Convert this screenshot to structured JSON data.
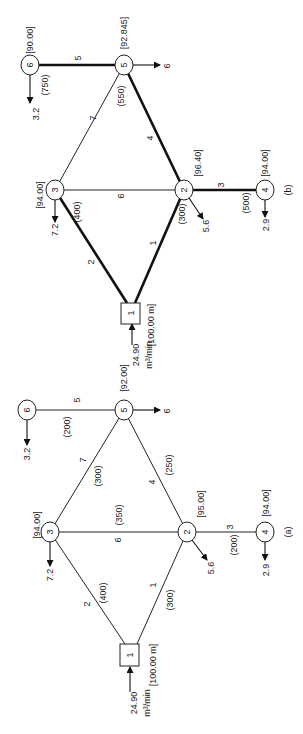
{
  "figure": {
    "panels": [
      {
        "id": "b",
        "label": "(b)",
        "nodes": [
          {
            "id": "1",
            "shape": "box",
            "head": "[100.00 m]",
            "inflow": "24.90",
            "inflow_unit": "m³/min"
          },
          {
            "id": "2",
            "shape": "circle",
            "head": "[96.40]",
            "demand": "5.6"
          },
          {
            "id": "3",
            "shape": "circle",
            "head": "[94.00]",
            "demand": "7.2"
          },
          {
            "id": "4",
            "shape": "circle",
            "head": "[94.00]",
            "demand": "2.9"
          },
          {
            "id": "5",
            "shape": "circle",
            "head": "[92.845]",
            "demand": "6"
          },
          {
            "id": "6",
            "shape": "circle",
            "head": "[90.00]",
            "demand": "3.2"
          }
        ],
        "pipes": [
          {
            "id": "1",
            "from": "1",
            "to": "2",
            "diameter": "(300)",
            "bold": true
          },
          {
            "id": "2",
            "from": "1",
            "to": "3",
            "diameter": "(400)",
            "bold": true
          },
          {
            "id": "3",
            "from": "2",
            "to": "4",
            "diameter": "(500)",
            "bold": true
          },
          {
            "id": "4",
            "from": "2",
            "to": "5",
            "diameter": "(550)",
            "bold": true
          },
          {
            "id": "5",
            "from": "5",
            "to": "6",
            "diameter": "(750)",
            "bold": true
          },
          {
            "id": "6",
            "from": "3",
            "to": "2",
            "diameter": "",
            "bold": false
          },
          {
            "id": "7",
            "from": "3",
            "to": "5",
            "diameter": "",
            "bold": false
          }
        ]
      },
      {
        "id": "a",
        "label": "(a)",
        "nodes": [
          {
            "id": "1",
            "shape": "box",
            "head": "[100.00 m]",
            "inflow": "24.90",
            "inflow_unit": "m³/min"
          },
          {
            "id": "2",
            "shape": "circle",
            "head": "[95.00]",
            "demand": "5.6"
          },
          {
            "id": "3",
            "shape": "circle",
            "head": "[94.00]",
            "demand": "7.2"
          },
          {
            "id": "4",
            "shape": "circle",
            "head": "[94.00]",
            "demand": "2.9"
          },
          {
            "id": "5",
            "shape": "circle",
            "head": "[92.00]",
            "demand": "6"
          },
          {
            "id": "6",
            "shape": "circle",
            "head": "",
            "demand": "3.2"
          }
        ],
        "pipes": [
          {
            "id": "1",
            "from": "1",
            "to": "2",
            "diameter": "(300)",
            "bold": false
          },
          {
            "id": "2",
            "from": "1",
            "to": "3",
            "diameter": "(400)",
            "bold": false
          },
          {
            "id": "3",
            "from": "2",
            "to": "4",
            "diameter": "(200)",
            "bold": false
          },
          {
            "id": "4",
            "from": "2",
            "to": "5",
            "diameter": "(250)",
            "bold": false
          },
          {
            "id": "5",
            "from": "5",
            "to": "6",
            "diameter": "(200)",
            "bold": false
          },
          {
            "id": "6",
            "from": "3",
            "to": "2",
            "diameter": "(350)",
            "bold": false
          },
          {
            "id": "7",
            "from": "3",
            "to": "5",
            "diameter": "(300)",
            "bold": false
          }
        ]
      }
    ]
  },
  "b": {
    "label": "(b)",
    "n1": "1",
    "n2": "2",
    "n3": "3",
    "n4": "4",
    "n5": "5",
    "n6": "6",
    "h1": "[100.00 m]",
    "h2": "[96.40]",
    "h3": "[94.00]",
    "h4": "[94.00]",
    "h5": "[92.845]",
    "h6": "[90.00]",
    "q_in": "24.90",
    "q_unit": "m³/min",
    "d2": "5.6",
    "d3": "7.2",
    "d4": "2.9",
    "d5": "6",
    "d6": "3.2",
    "p1": "1",
    "p2": "2",
    "p3": "3",
    "p4": "4",
    "p5": "5",
    "p6": "6",
    "p7": "7",
    "dia1": "(300)",
    "dia2": "(400)",
    "dia3": "(500)",
    "dia4": "(550)",
    "dia5": "(750)"
  },
  "a": {
    "label": "(a)",
    "n1": "1",
    "n2": "2",
    "n3": "3",
    "n4": "4",
    "n5": "5",
    "n6": "6",
    "h1": "[100.00 m]",
    "h2": "[95.00]",
    "h3": "[94.00]",
    "h4": "[94.00]",
    "h5": "[92.00]",
    "q_in": "24.90",
    "q_unit": "m³/min",
    "d2": "5.6",
    "d3": "7.2",
    "d4": "2.9",
    "d5": "6",
    "d6": "3.2",
    "p1": "1",
    "p2": "2",
    "p3": "3",
    "p4": "4",
    "p5": "5",
    "p6": "6",
    "p7": "7",
    "dia1": "(300)",
    "dia2": "(400)",
    "dia3": "(200)",
    "dia4": "(250)",
    "dia5": "(200)",
    "dia6": "(350)",
    "dia7": "(300)"
  }
}
